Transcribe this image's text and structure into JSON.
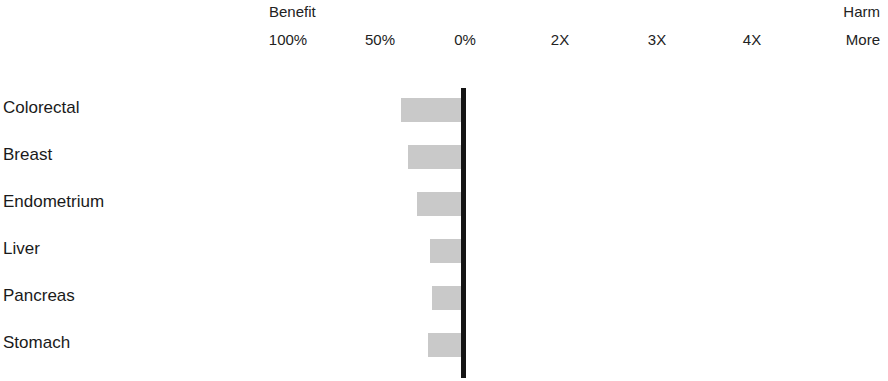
{
  "axis": {
    "benefit_label": "Benefit",
    "harm_label": "Harm",
    "ticks": [
      {
        "label": "100%",
        "x": 288
      },
      {
        "label": "50%",
        "x": 380
      },
      {
        "label": "0%",
        "x": 465
      },
      {
        "label": "2X",
        "x": 560
      },
      {
        "label": "3X",
        "x": 657
      },
      {
        "label": "4X",
        "x": 752
      }
    ],
    "end_tick_label": "More"
  },
  "style": {
    "bar_color": "#c9c9c9",
    "zero_line_color": "#141414",
    "background": "#ffffff",
    "text_color": "#1a1a1a"
  },
  "chart_data": {
    "type": "bar",
    "orientation": "horizontal",
    "title": "",
    "subtitle": "",
    "xlabel": "",
    "ylabel": "",
    "categories": [
      "Colorectal",
      "Breast",
      "Endometrium",
      "Liver",
      "Pancreas",
      "Stomach"
    ],
    "values": [
      -38,
      -34,
      -28,
      -21,
      -19,
      -22
    ],
    "value_unit": "percent risk change",
    "value_note": "Negative values indicate percent risk reduction (benefit, left of 0%); positive values would indicate fold-increase in risk (harm, right of 0%).",
    "series": [
      {
        "name": "Risk change",
        "values": [
          -38,
          -34,
          -28,
          -21,
          -19,
          -22
        ]
      }
    ],
    "axis_tick_labels": [
      "100%",
      "50%",
      "0%",
      "2X",
      "3X",
      "4X"
    ],
    "axis_direction_labels": {
      "left": "Benefit",
      "right": "Harm",
      "right_end": "More"
    },
    "xlim": [
      -100,
      400
    ],
    "grid": false,
    "legend": "none",
    "zero_reference": "0%",
    "bars": [
      {
        "category": "Colorectal",
        "left": 401,
        "right": 463,
        "top": 98,
        "height": 24
      },
      {
        "category": "Breast",
        "left": 408,
        "right": 463,
        "top": 145,
        "height": 24
      },
      {
        "category": "Endometrium",
        "left": 417,
        "right": 463,
        "top": 192,
        "height": 24
      },
      {
        "category": "Liver",
        "left": 430,
        "right": 463,
        "top": 239,
        "height": 24
      },
      {
        "category": "Pancreas",
        "left": 432,
        "right": 463,
        "top": 286,
        "height": 24
      },
      {
        "category": "Stomach",
        "left": 428,
        "right": 463,
        "top": 333,
        "height": 24
      }
    ],
    "category_label_positions": [
      108,
      155,
      202,
      249,
      296,
      343
    ]
  }
}
